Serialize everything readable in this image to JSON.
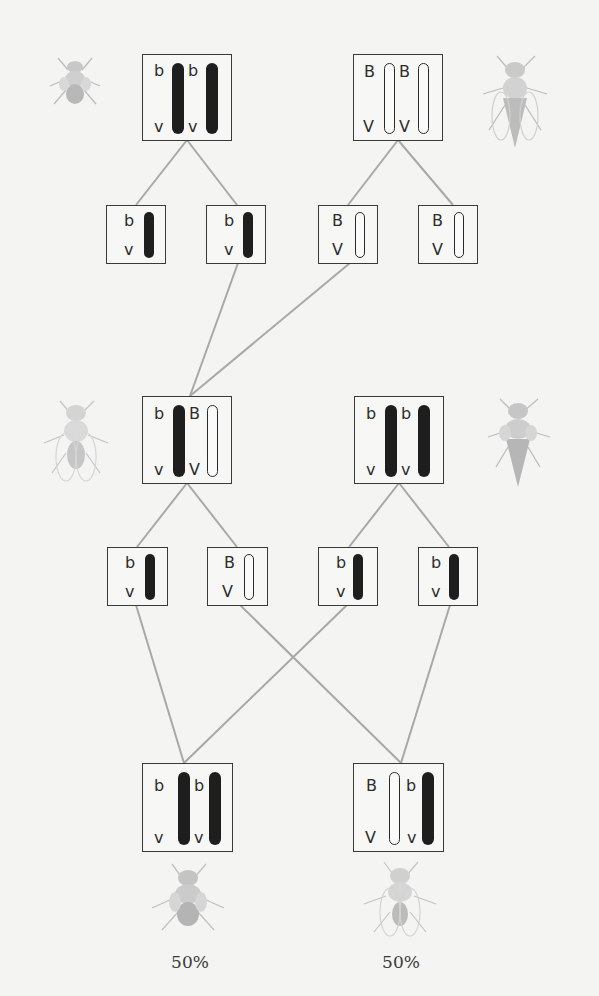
{
  "diagram": {
    "title": "",
    "colors": {
      "recessive_chromosome": "#1e1e1e",
      "dominant_chromosome": "#fafafa",
      "line": "#a8a8a8",
      "box_border": "#3a3a3a"
    },
    "generations": {
      "parents": [
        {
          "id": "P1",
          "genotype": "bv/bv",
          "chromosomes": [
            {
              "top": "b",
              "bottom": "v",
              "type": "dark"
            },
            {
              "top": "b",
              "bottom": "v",
              "type": "dark"
            }
          ],
          "fly": "black-vestigial-fly-icon"
        },
        {
          "id": "P2",
          "genotype": "BV/BV",
          "chromosomes": [
            {
              "top": "B",
              "bottom": "V",
              "type": "light"
            },
            {
              "top": "B",
              "bottom": "V",
              "type": "light"
            }
          ],
          "fly": "wild-type-fly-icon"
        }
      ],
      "gametes_1": [
        {
          "top": "b",
          "bottom": "v",
          "type": "dark"
        },
        {
          "top": "b",
          "bottom": "v",
          "type": "dark"
        },
        {
          "top": "B",
          "bottom": "V",
          "type": "light"
        },
        {
          "top": "B",
          "bottom": "V",
          "type": "light"
        }
      ],
      "f1_cross": [
        {
          "id": "F1",
          "genotype": "bv/BV",
          "chromosomes": [
            {
              "top": "b",
              "bottom": "v",
              "type": "dark"
            },
            {
              "top": "B",
              "bottom": "V",
              "type": "light"
            }
          ],
          "fly": "wild-type-fly-icon"
        },
        {
          "id": "Tester",
          "genotype": "bv/bv",
          "chromosomes": [
            {
              "top": "b",
              "bottom": "v",
              "type": "dark"
            },
            {
              "top": "b",
              "bottom": "v",
              "type": "dark"
            }
          ],
          "fly": "black-vestigial-fly-icon"
        }
      ],
      "gametes_2": [
        {
          "top": "b",
          "bottom": "v",
          "type": "dark"
        },
        {
          "top": "B",
          "bottom": "V",
          "type": "light"
        },
        {
          "top": "b",
          "bottom": "v",
          "type": "dark"
        },
        {
          "top": "b",
          "bottom": "v",
          "type": "dark"
        }
      ],
      "offspring": [
        {
          "id": "O1",
          "genotype": "bv/bv",
          "chromosomes": [
            {
              "top": "b",
              "bottom": "v",
              "type": "dark"
            },
            {
              "top": "b",
              "bottom": "v",
              "type": "dark"
            }
          ],
          "fly": "black-vestigial-fly-icon",
          "percentage": "50%"
        },
        {
          "id": "O2",
          "genotype": "BV/bv",
          "chromosomes": [
            {
              "top": "B",
              "bottom": "V",
              "type": "light"
            },
            {
              "top": "b",
              "bottom": "v",
              "type": "dark"
            }
          ],
          "fly": "wild-type-fly-icon",
          "percentage": "50%"
        }
      ]
    }
  }
}
